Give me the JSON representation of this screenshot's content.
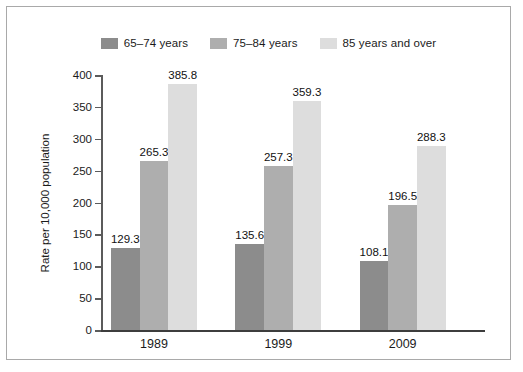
{
  "chart_data": {
    "type": "bar",
    "title": "",
    "subtitle": "",
    "xlabel": "",
    "ylabel": "Rate per 10,000 population",
    "categories": [
      "1989",
      "1999",
      "2009"
    ],
    "ylim": [
      0,
      400
    ],
    "yticks": [
      0,
      50,
      100,
      150,
      200,
      250,
      300,
      350,
      400
    ],
    "ytick_labels": [
      "0",
      "50",
      "100",
      "150",
      "200",
      "250",
      "300",
      "350",
      "400"
    ],
    "grid": false,
    "legend_position": "top-center",
    "data_labels": true,
    "series": [
      {
        "name": "65–74 years",
        "color": "#8c8c8c",
        "values": [
          129.3,
          135.6,
          108.1
        ],
        "value_labels": [
          "129.3",
          "135.6",
          "108.1"
        ]
      },
      {
        "name": "75–84 years",
        "color": "#aeaeae",
        "values": [
          265.3,
          257.3,
          196.5
        ],
        "value_labels": [
          "265.3",
          "257.3",
          "196.5"
        ]
      },
      {
        "name": "85 years and over",
        "color": "#dddddd",
        "values": [
          385.8,
          359.3,
          288.3
        ],
        "value_labels": [
          "385.8",
          "359.3",
          "288.3"
        ]
      }
    ]
  },
  "colors": {
    "border": "#a9a9a9",
    "axis": "#3d3d3d",
    "text": "#1b1b1b",
    "background": "#ffffff"
  }
}
